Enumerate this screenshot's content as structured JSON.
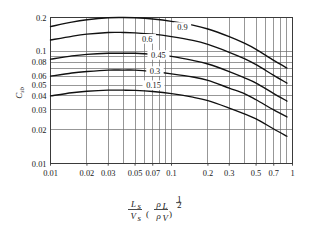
{
  "chart_data": {
    "type": "line",
    "title": "",
    "xlabel": "Ls / Vs (rhoL / rhoV)^(1/2)",
    "ylabel": "Csb",
    "xscale": "log",
    "yscale": "log",
    "xlim": [
      0.01,
      1
    ],
    "ylim": [
      0.01,
      0.2
    ],
    "grid": true,
    "legend_position": "inline-curve-labels",
    "xtick_labels": [
      "0.01",
      "0.02",
      "0.03",
      "0.05",
      "0.07",
      "0.1",
      "0.2",
      "0.3",
      "0.5",
      "0.7",
      "1"
    ],
    "xtick_values": [
      0.01,
      0.02,
      0.03,
      0.05,
      0.07,
      0.1,
      0.2,
      0.3,
      0.5,
      0.7,
      1
    ],
    "ytick_labels": [
      "0.2",
      "0.1",
      "0.08",
      "0.06",
      "0.05",
      "0.04",
      "0.03",
      "0.02",
      "0.01"
    ],
    "ytick_values": [
      0.2,
      0.1,
      0.08,
      0.06,
      0.05,
      0.04,
      0.03,
      0.02,
      0.01
    ],
    "series": [
      {
        "name": "0.9",
        "label": "0.9",
        "label_x": 0.123,
        "label_y": 0.163,
        "x": [
          0.01,
          0.015,
          0.02,
          0.03,
          0.04,
          0.05,
          0.07,
          0.1,
          0.15,
          0.2,
          0.3,
          0.4,
          0.5,
          0.7,
          0.9
        ],
        "values": [
          0.166,
          0.182,
          0.191,
          0.199,
          0.2,
          0.199,
          0.194,
          0.185,
          0.171,
          0.158,
          0.135,
          0.118,
          0.104,
          0.083,
          0.071
        ]
      },
      {
        "name": "0.6",
        "label": "0.6",
        "label_x": 0.063,
        "label_y": 0.128,
        "x": [
          0.01,
          0.015,
          0.02,
          0.03,
          0.04,
          0.05,
          0.07,
          0.1,
          0.15,
          0.2,
          0.3,
          0.4,
          0.5,
          0.7,
          0.9
        ],
        "values": [
          0.126,
          0.136,
          0.142,
          0.147,
          0.147,
          0.146,
          0.142,
          0.135,
          0.125,
          0.115,
          0.098,
          0.086,
          0.076,
          0.061,
          0.052
        ]
      },
      {
        "name": "0.45",
        "label": "0.45",
        "label_x": 0.078,
        "label_y": 0.092,
        "x": [
          0.01,
          0.015,
          0.02,
          0.03,
          0.04,
          0.05,
          0.07,
          0.1,
          0.15,
          0.2,
          0.3,
          0.4,
          0.5,
          0.7,
          0.9
        ],
        "values": [
          0.085,
          0.091,
          0.094,
          0.096,
          0.096,
          0.096,
          0.094,
          0.09,
          0.083,
          0.077,
          0.066,
          0.058,
          0.052,
          0.042,
          0.036
        ]
      },
      {
        "name": "0.3",
        "label": "0.3",
        "label_x": 0.073,
        "label_y": 0.066,
        "x": [
          0.01,
          0.015,
          0.02,
          0.03,
          0.04,
          0.05,
          0.07,
          0.1,
          0.15,
          0.2,
          0.3,
          0.4,
          0.5,
          0.7,
          0.9
        ],
        "values": [
          0.06,
          0.064,
          0.066,
          0.068,
          0.068,
          0.068,
          0.066,
          0.063,
          0.059,
          0.055,
          0.047,
          0.042,
          0.037,
          0.03,
          0.026
        ]
      },
      {
        "name": "0.15",
        "label": "0.15",
        "label_x": 0.071,
        "label_y": 0.0495,
        "x": [
          0.01,
          0.015,
          0.02,
          0.03,
          0.04,
          0.05,
          0.07,
          0.1,
          0.15,
          0.2,
          0.3,
          0.4,
          0.5,
          0.7,
          0.9
        ],
        "values": [
          0.04,
          0.0427,
          0.044,
          0.045,
          0.045,
          0.0448,
          0.0438,
          0.042,
          0.039,
          0.0363,
          0.0312,
          0.0277,
          0.025,
          0.0203,
          0.0175
        ]
      }
    ]
  },
  "axis_titles": {
    "y": {
      "base": "C",
      "sub": "sb"
    },
    "x": {
      "numerator_base": "L",
      "numerator_sub": "s",
      "denominator_base": "V",
      "denominator_sub": "s",
      "paren_numerator_base": "ρ",
      "paren_numerator_sub": "L",
      "paren_denominator_base": "ρ",
      "paren_denominator_sub": "V",
      "exponent_numerator": "1",
      "exponent_denominator": "2"
    }
  },
  "colors": {
    "curve": "#111111",
    "grid": "#6b6b6b",
    "frame": "#3a3a3a",
    "text": "#1a1a1a",
    "background": "#ffffff"
  }
}
